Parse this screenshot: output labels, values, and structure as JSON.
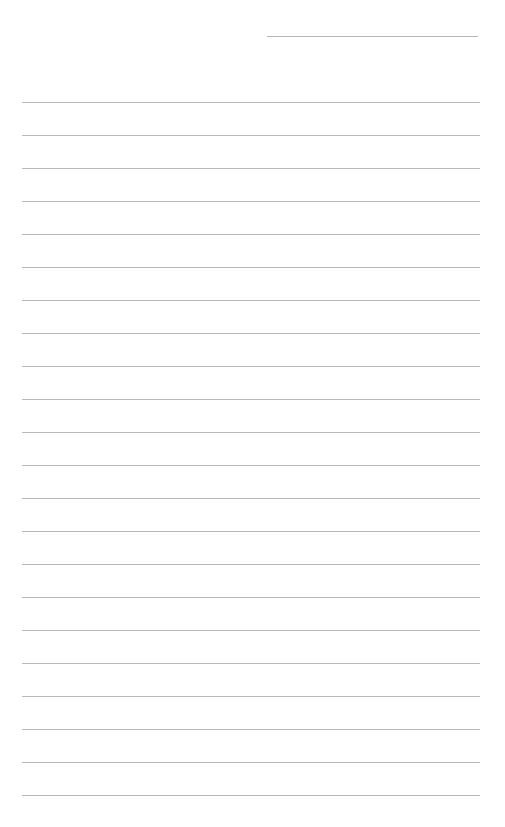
{
  "page": {
    "type": "lined-paper",
    "background": "#ffffff",
    "line_color": "#b8b8b8",
    "header_line": {
      "top": 36,
      "left": 267,
      "width": 211
    },
    "ruled_lines": {
      "first_top": 102,
      "spacing": 33,
      "count": 22,
      "left": 22,
      "width": 458
    }
  }
}
